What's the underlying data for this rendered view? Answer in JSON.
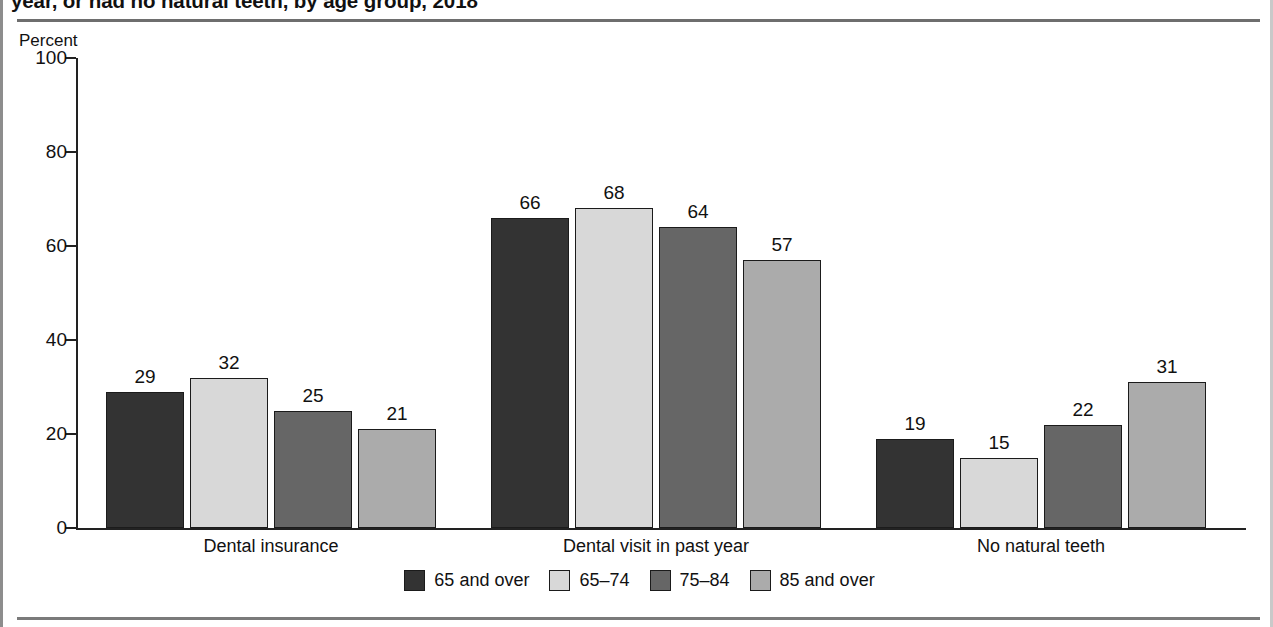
{
  "figure": {
    "title": "year, or had no natural teeth, by age group, 2018",
    "axis_caption": "Percent"
  },
  "legend": {
    "items": [
      {
        "label": "65 and over",
        "color": "#333333"
      },
      {
        "label": "65–74",
        "color": "#d8d8d8"
      },
      {
        "label": "75–84",
        "color": "#666666"
      },
      {
        "label": "85 and over",
        "color": "#ababab"
      }
    ]
  },
  "chart_data": {
    "type": "bar",
    "title": "year, or had no natural teeth, by age group, 2018",
    "xlabel": "",
    "ylabel": "Percent",
    "ylim": [
      0,
      100
    ],
    "yticks": [
      0,
      20,
      40,
      60,
      80,
      100
    ],
    "ytick_labels": [
      "0",
      "20",
      "40",
      "60",
      "80",
      "100"
    ],
    "grid": false,
    "legend_position": "bottom",
    "categories": [
      "Dental insurance",
      "Dental visit in past year",
      "No natural teeth"
    ],
    "series": [
      {
        "name": "65 and over",
        "color": "#333333",
        "values": [
          29,
          66,
          19
        ]
      },
      {
        "name": "65–74",
        "color": "#d8d8d8",
        "values": [
          32,
          68,
          15
        ]
      },
      {
        "name": "75–84",
        "color": "#666666",
        "values": [
          25,
          64,
          22
        ]
      },
      {
        "name": "85 and over",
        "color": "#ababab",
        "values": [
          21,
          57,
          31
        ]
      }
    ],
    "data_labels": [
      [
        "29",
        "32",
        "25",
        "21"
      ],
      [
        "66",
        "68",
        "64",
        "57"
      ],
      [
        "19",
        "15",
        "22",
        "31"
      ]
    ]
  }
}
